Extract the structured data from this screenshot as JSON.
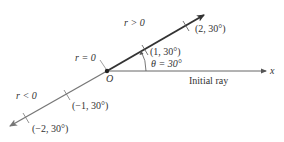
{
  "diagram": {
    "colors": {
      "positive_ray": "#333333",
      "negative_ray": "#777777",
      "initial_ray": "#555555",
      "text": "#333333",
      "background": "#ffffff"
    },
    "labels": {
      "r_positive": "r > 0",
      "r_zero": "r = 0",
      "r_negative": "r < 0",
      "origin": "O",
      "theta": "θ = 30°",
      "initial_ray": "Initial ray",
      "x_axis": "x"
    },
    "points": [
      {
        "label": "(1, 30°)",
        "r": 1,
        "theta_deg": 30
      },
      {
        "label": "(2, 30°)",
        "r": 2,
        "theta_deg": 30
      },
      {
        "label": "(−1, 30°)",
        "r": -1,
        "theta_deg": 30
      },
      {
        "label": "(−2, 30°)",
        "r": -2,
        "theta_deg": 30
      }
    ]
  }
}
